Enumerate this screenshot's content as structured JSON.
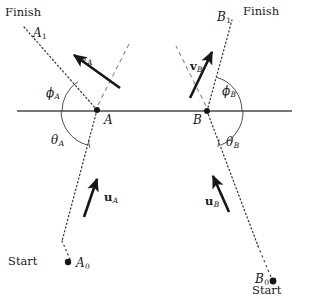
{
  "figure": {
    "background_color": "#ffffff",
    "line_color": "#2b2b2b",
    "width": 309,
    "height": 299
  },
  "labels": {
    "finish_left": "Finish",
    "finish_right": "Finish",
    "start_left": "Start",
    "start_right": "Start",
    "a1": "A",
    "a1_sub": "1",
    "b1": "B",
    "b1_sub": "1",
    "a_point": "A",
    "b_point": "B",
    "a0": "A",
    "a0_sub": "0",
    "b0": "B",
    "b0_sub": "0",
    "v_a": "v",
    "v_a_sub": "A",
    "v_b": "v",
    "v_b_sub": "B",
    "u_a": "u",
    "u_a_sub": "A",
    "u_b": "u",
    "u_b_sub": "B",
    "phi_a": "ϕ",
    "phi_a_sub": "A",
    "phi_b": "ϕ",
    "phi_b_sub": "B",
    "theta_a": "θ",
    "theta_a_sub": "A",
    "theta_b": "θ",
    "theta_b_sub": "B"
  },
  "geometry": {
    "interface_line": {
      "x1": 17,
      "y1": 111,
      "x2": 292,
      "y2": 111
    },
    "point_a": {
      "x": 97,
      "y": 110
    },
    "point_b": {
      "x": 207,
      "y": 111
    },
    "point_a0": {
      "x": 68,
      "y": 262
    },
    "point_b0": {
      "x": 273,
      "y": 281
    },
    "path_a_upper": {
      "x1": 97,
      "y1": 110,
      "x2": 24,
      "y2": 27
    },
    "path_a_lower": {
      "x1": 97,
      "y1": 110,
      "x2": 60,
      "y2": 247
    },
    "path_b_upper": {
      "x1": 207,
      "y1": 111,
      "x2": 232,
      "y2": 20
    },
    "path_b_lower": {
      "x1": 207,
      "y1": 111,
      "x2": 265,
      "y2": 265
    },
    "normal_a": {
      "x1": 97,
      "y1": 110,
      "x2": 129,
      "y2": 43
    },
    "normal_b": {
      "x1": 207,
      "y1": 111,
      "x2": 177,
      "y2": 47
    },
    "arrow_va": {
      "x1": 118,
      "y1": 86,
      "x2": 71,
      "y2": 54
    },
    "arrow_vb": {
      "x1": 191,
      "y1": 96,
      "x2": 213,
      "y2": 50
    },
    "arrow_ua": {
      "x1": 85,
      "y1": 215,
      "x2": 98,
      "y2": 177
    },
    "arrow_ub": {
      "x1": 228,
      "y1": 210,
      "x2": 212,
      "y2": 174
    }
  }
}
